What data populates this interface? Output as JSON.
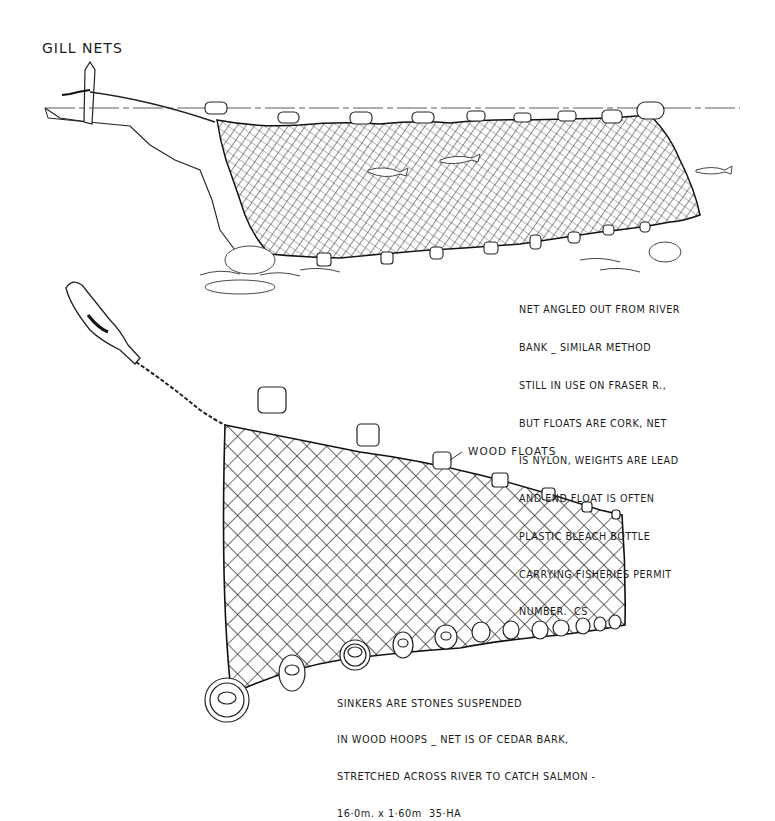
{
  "title": "GILL NETS",
  "upper_illustration": {
    "subject": "nylon gill net angled out from river bank",
    "float_count": 10,
    "weight_count": 10,
    "fish_count": 3,
    "note_lines": [
      "NET ANGLED OUT FROM RIVER",
      "BANK _ SIMILAR METHOD",
      "STILL IN USE ON FRASER R.,",
      "BUT FLOATS ARE CORK, NET",
      "IS NYLON, WEIGHTS ARE LEAD",
      "AND END FLOAT IS OFTEN",
      "PLASTIC BLEACH BOTTLE",
      "CARRYING FISHERIES PERMIT",
      "NUMBER.  CS"
    ]
  },
  "lower_illustration": {
    "subject": "cedar bark net with wood floats and hoop sinkers",
    "float_label": "WOOD FLOATS",
    "float_count": 6,
    "sinker_count": 12,
    "note_lines": [
      "SINKERS ARE STONES SUSPENDED",
      "IN WOOD HOOPS _ NET IS OF CEDAR BARK,",
      "STRETCHED ACROSS RIVER TO CATCH SALMON -"
    ],
    "dimensions": "16·0m. x 1·60m  35·HA"
  },
  "colors": {
    "ink": "#1c1c1c",
    "paper": "#ffffff"
  }
}
